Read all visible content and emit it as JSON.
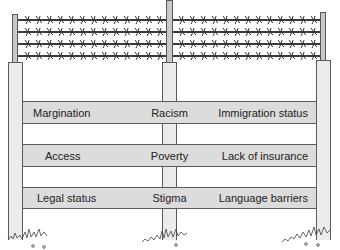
{
  "diagram": {
    "type": "fence-metaphor",
    "colors": {
      "post_fill": "#ececec",
      "pole_fill": "#c9c9c9",
      "plank_fill": "#dcdcdc",
      "outline": "#5a5a5a",
      "wire": "#3a3a3a"
    },
    "planks": [
      {
        "left": "Margination",
        "center": "Racism",
        "right": "Immigration status"
      },
      {
        "left": "Access",
        "center": "Poverty",
        "right": "Lack of insurance"
      },
      {
        "left": "Legal status",
        "center": "Stigma",
        "right": "Language barriers"
      }
    ],
    "barbed_wire_strands": 4
  }
}
